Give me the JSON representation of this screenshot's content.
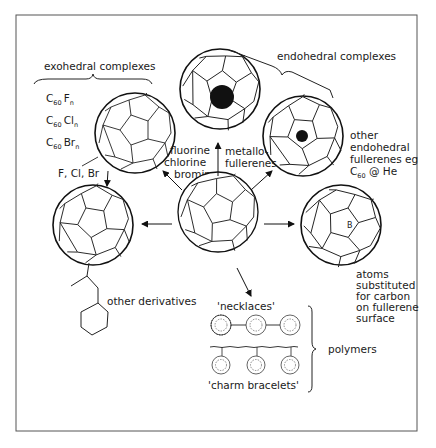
{
  "diagram": {
    "type": "fullerene-derivatives-overview",
    "frame": {
      "x": 16,
      "y": 15,
      "w": 401,
      "h": 416,
      "stroke": "#555555"
    },
    "groups": {
      "exohedral": {
        "label": "exohedral complexes"
      },
      "endohedral": {
        "label": "endohedral complexes"
      },
      "polymers": {
        "label": "polymers"
      }
    },
    "formulas": [
      {
        "base": "C",
        "sub": "60",
        "elem": "F",
        "n": "n"
      },
      {
        "base": "C",
        "sub": "60",
        "elem": "Cl",
        "n": "n"
      },
      {
        "base": "C",
        "sub": "60",
        "elem": "Br",
        "n": "n"
      }
    ],
    "labels": {
      "halogens_short": "F, Cl, Br",
      "halogens_long": [
        "fluorine",
        "chlorine",
        "bromine"
      ],
      "metallo": [
        "metallo-",
        "fullerenes"
      ],
      "other_endohedral": [
        "other",
        "endohedral",
        "fullerenes eg"
      ],
      "c60_he": {
        "base": "C",
        "sub": "60",
        "rest": " @ He"
      },
      "other_derivatives": "other derivatives",
      "substituted": [
        "atoms",
        "substituted",
        "for carbon",
        "on fullerene",
        "surface"
      ],
      "boron_atom": "B",
      "necklaces": "'necklaces'",
      "charm_bracelets": "'charm bracelets'"
    },
    "nodes": [
      {
        "id": "center",
        "name": "C60 fullerene",
        "cx": 218,
        "cy": 212,
        "r": 40
      },
      {
        "id": "halogenated",
        "name": "halogenated C60",
        "cx": 135,
        "cy": 133,
        "r": 40
      },
      {
        "id": "metallofullerene",
        "name": "metallofullerene",
        "cx": 220,
        "cy": 89,
        "r": 40,
        "core_r": 12
      },
      {
        "id": "endohedral-he",
        "name": "C60@He",
        "cx": 303,
        "cy": 136,
        "r": 40,
        "core_r": 6
      },
      {
        "id": "derivative",
        "name": "C60 derivative",
        "cx": 93,
        "cy": 225,
        "r": 40
      },
      {
        "id": "substituted",
        "name": "B-substituted C60",
        "cx": 341,
        "cy": 225,
        "r": 40
      }
    ]
  }
}
